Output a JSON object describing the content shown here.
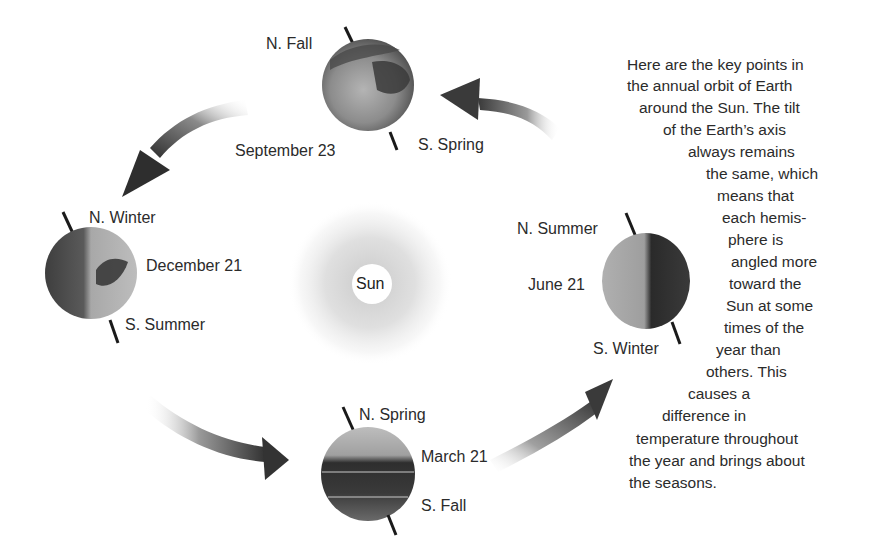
{
  "diagram": {
    "sun": {
      "label": "Sun"
    },
    "positions": [
      {
        "id": "september",
        "date": "September 23",
        "north": "N. Fall",
        "south": "S. Spring"
      },
      {
        "id": "december",
        "date": "December 21",
        "north": "N. Winter",
        "south": "S. Summer"
      },
      {
        "id": "march",
        "date": "March 21",
        "north": "N. Spring",
        "south": "S. Fall"
      },
      {
        "id": "june",
        "date": "June 21",
        "north": "N. Summer",
        "south": "S. Winter"
      }
    ],
    "arrows": [
      {
        "from": "june",
        "to": "september",
        "direction": "counterclockwise"
      },
      {
        "from": "september",
        "to": "december",
        "direction": "counterclockwise"
      },
      {
        "from": "december",
        "to": "march",
        "direction": "counterclockwise"
      },
      {
        "from": "march",
        "to": "june",
        "direction": "counterclockwise"
      }
    ],
    "description_lines": [
      "Here are the key points in",
      "the annual orbit of Earth",
      "around the Sun. The tilt",
      "of the Earth’s axis",
      "always remains",
      "the same, which",
      "means that",
      "each hemis-",
      "phere is",
      "angled more",
      "toward the",
      "Sun at some",
      "times of the",
      "year than",
      "others. This",
      "causes a",
      "difference in",
      "temperature throughout",
      "the year and brings about",
      "the seasons."
    ],
    "colors": {
      "background": "#ffffff",
      "text": "#2b2b2b",
      "arrow_dark": "#3a3a3a",
      "axis": "#1a1a1a"
    }
  }
}
